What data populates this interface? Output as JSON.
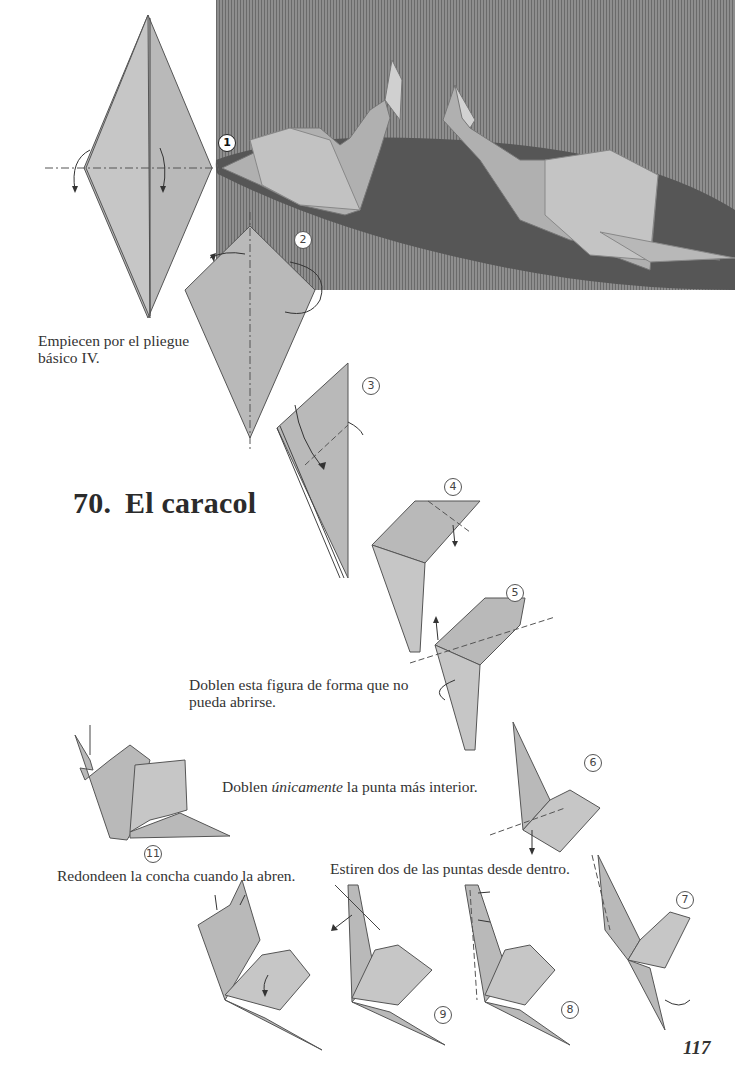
{
  "page": {
    "title_number": "70.",
    "title_text": "El caracol",
    "page_number": "117"
  },
  "captions": {
    "start": "Empiecen por el pliegue básico IV.",
    "fold_closed_line1": "Doblen esta figura de forma que no",
    "fold_closed_line2": "pueda abrirse.",
    "fold_inner_prefix": "Doblen ",
    "fold_inner_emph": "únicamente",
    "fold_inner_suffix": " la punta más interior.",
    "stretch_points": "Estiren dos de las puntas desde dentro.",
    "round_shell": "Redondeen la concha cuando la abren."
  },
  "photo": {
    "description": "photo-of-two-origami-snails",
    "step_label": "1"
  },
  "steps": [
    {
      "id": "1",
      "label": "1"
    },
    {
      "id": "2",
      "label": "2"
    },
    {
      "id": "3",
      "label": "3"
    },
    {
      "id": "4",
      "label": "4"
    },
    {
      "id": "5",
      "label": "5"
    },
    {
      "id": "6",
      "label": "6"
    },
    {
      "id": "7",
      "label": "7"
    },
    {
      "id": "8",
      "label": "8"
    },
    {
      "id": "9",
      "label": "9"
    },
    {
      "id": "11",
      "label": "11"
    }
  ],
  "colors": {
    "paper": "#b9b9b9",
    "photo_background": "#7c7c7c",
    "photo_table": "#555555",
    "text": "#2a2a2a"
  }
}
